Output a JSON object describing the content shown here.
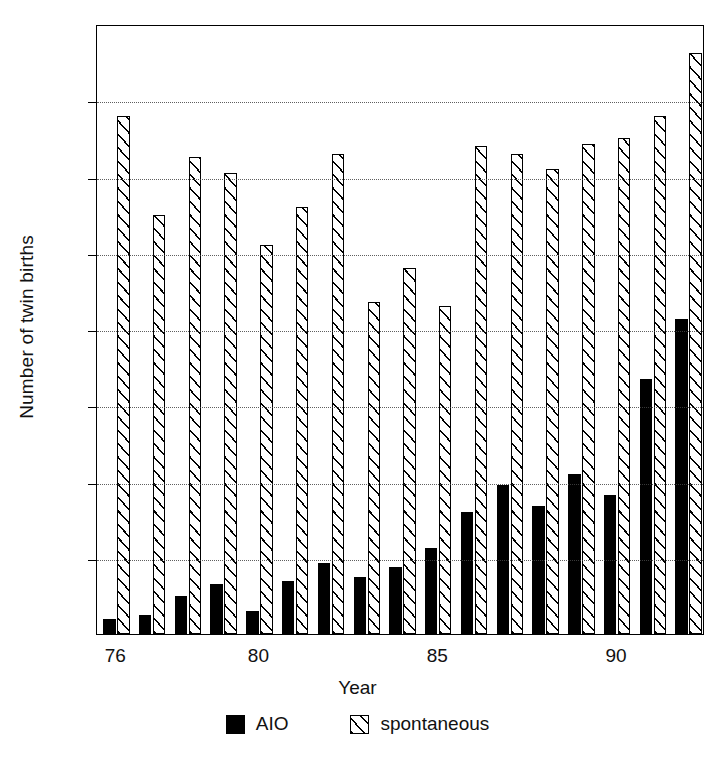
{
  "chart_data": {
    "type": "bar",
    "title": "",
    "xlabel": "Year",
    "ylabel": "Number of twin births",
    "ylim": [
      0,
      160
    ],
    "ytick_values": [
      0,
      20,
      40,
      60,
      80,
      100,
      120,
      140,
      160
    ],
    "ytick_labels": [
      "0",
      "20",
      "40",
      "60",
      "80",
      "100",
      "120",
      "140",
      "160"
    ],
    "grid": "horizontal-dotted",
    "legend_position": "below-axis-center",
    "categories": [
      76,
      77,
      78,
      79,
      80,
      81,
      82,
      83,
      84,
      85,
      86,
      87,
      88,
      89,
      90,
      91,
      92
    ],
    "xtick_values": [
      76,
      80,
      85,
      90
    ],
    "xtick_labels": [
      "76",
      "80",
      "85",
      "90"
    ],
    "series": [
      {
        "name": "AIO",
        "style": "solid-black",
        "color": "#000000",
        "values": [
          4,
          5,
          10,
          13,
          6,
          14,
          18.5,
          15,
          17.5,
          22.5,
          32,
          39,
          33.5,
          42,
          36.5,
          67,
          82.5
        ]
      },
      {
        "name": "spontaneous",
        "style": "hatched",
        "color": "#ffffff",
        "values": [
          136,
          110,
          125,
          121,
          102,
          112,
          126,
          87,
          96,
          86,
          128,
          126,
          122,
          128.5,
          130,
          136,
          152.5
        ]
      }
    ]
  },
  "legend": {
    "items": [
      {
        "label": "AIO"
      },
      {
        "label": "spontaneous"
      }
    ]
  }
}
